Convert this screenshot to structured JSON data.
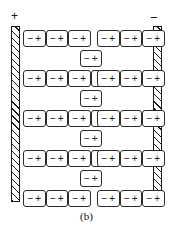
{
  "figure": {
    "caption": "(b)",
    "kind": "dielectric-polarization-diagram"
  },
  "electrodes": {
    "left": {
      "polarity_label": "+",
      "name": "positive-plate"
    },
    "right": {
      "polarity_label": "−",
      "name": "negative-plate"
    }
  },
  "dipole": {
    "negative_symbol": "−",
    "positive_symbol": "+"
  },
  "colors": {
    "ink": "#1a1a1a",
    "cell_stroke": "#2b2b2b",
    "background": "#ffffff"
  },
  "chart_data": {
    "type": "diagram",
    "title": "(b)",
    "rows": [
      {
        "index": 0,
        "y": 30,
        "left_group": [
          {
            "x": 23,
            "neg": "−",
            "pos": "+"
          },
          {
            "x": 45.5,
            "neg": "−",
            "pos": "+"
          },
          {
            "x": 68,
            "neg": "−",
            "pos": "+"
          }
        ],
        "middle": null,
        "right_group": [
          {
            "x": 97,
            "neg": "−",
            "pos": "+"
          },
          {
            "x": 119.5,
            "neg": "−",
            "pos": "+"
          },
          {
            "x": 142,
            "neg": "−",
            "pos": "+"
          }
        ]
      },
      {
        "index": 1,
        "y": 70,
        "left_group": [
          {
            "x": 23,
            "neg": "−",
            "pos": "+"
          },
          {
            "x": 45.5,
            "neg": "−",
            "pos": "+"
          },
          {
            "x": 68,
            "neg": "−",
            "pos": "+"
          }
        ],
        "middle": {
          "x": 90.5,
          "blank": true
        },
        "right_group": [
          {
            "x": 97,
            "neg": "−",
            "pos": "+"
          },
          {
            "x": 119.5,
            "neg": "−",
            "pos": "+"
          },
          {
            "x": 142,
            "neg": "−",
            "pos": "+"
          }
        ]
      },
      {
        "index": 2,
        "y": 110,
        "left_group": [
          {
            "x": 23,
            "neg": "−",
            "pos": "+"
          },
          {
            "x": 45.5,
            "neg": "−",
            "pos": "+"
          },
          {
            "x": 68,
            "neg": "−",
            "pos": "+"
          }
        ],
        "middle": {
          "x": 90.5,
          "blank": true
        },
        "right_group": [
          {
            "x": 97,
            "neg": "−",
            "pos": "+"
          },
          {
            "x": 119.5,
            "neg": "−",
            "pos": "+"
          },
          {
            "x": 142,
            "neg": "−",
            "pos": "+"
          }
        ]
      },
      {
        "index": 3,
        "y": 150,
        "left_group": [
          {
            "x": 23,
            "neg": "−",
            "pos": "+"
          },
          {
            "x": 45.5,
            "neg": "−",
            "pos": "+"
          },
          {
            "x": 68,
            "neg": "−",
            "pos": "+"
          }
        ],
        "middle": {
          "x": 90.5,
          "blank": true
        },
        "right_group": [
          {
            "x": 97,
            "neg": "−",
            "pos": "+"
          },
          {
            "x": 119.5,
            "neg": "−",
            "pos": "+"
          },
          {
            "x": 142,
            "neg": "−",
            "pos": "+"
          }
        ]
      },
      {
        "index": 4,
        "y": 190,
        "left_group": [
          {
            "x": 23,
            "neg": "−",
            "pos": "+"
          },
          {
            "x": 45.5,
            "neg": "−",
            "pos": "+"
          },
          {
            "x": 68,
            "neg": "−",
            "pos": "+"
          }
        ],
        "middle": null,
        "right_group": [
          {
            "x": 97,
            "neg": "−",
            "pos": "+"
          },
          {
            "x": 119.5,
            "neg": "−",
            "pos": "+"
          },
          {
            "x": 142,
            "neg": "−",
            "pos": "+"
          }
        ]
      }
    ],
    "bridges": [
      {
        "index": 0,
        "x": 79.5,
        "y": 50,
        "neg": "−",
        "pos": "+"
      },
      {
        "index": 1,
        "x": 79.5,
        "y": 90,
        "neg": "−",
        "pos": "+"
      },
      {
        "index": 2,
        "x": 79.5,
        "y": 130,
        "neg": "−",
        "pos": "+"
      },
      {
        "index": 3,
        "x": 79.5,
        "y": 170,
        "neg": "−",
        "pos": "+"
      }
    ]
  }
}
